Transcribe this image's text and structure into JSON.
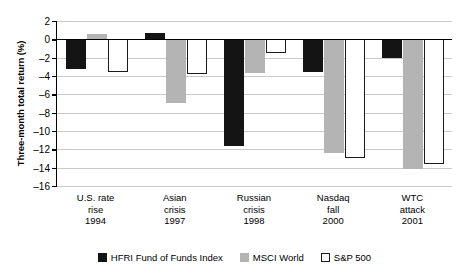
{
  "chart_data": {
    "type": "bar",
    "title": "",
    "xlabel": "",
    "ylabel": "Three-month total return (%)",
    "ylim": [
      -16,
      2
    ],
    "ytick_step": 2,
    "yticks": [
      2,
      0,
      -2,
      -4,
      -6,
      -8,
      -10,
      -12,
      -14,
      -16
    ],
    "ytick_labels": [
      "2",
      "0",
      "–2",
      "–4",
      "–6",
      "–8",
      "–10",
      "–12",
      "–14",
      "–16"
    ],
    "grid": true,
    "legend_position": "bottom",
    "categories": [
      "U.S. rate rise 1994",
      "Asian crisis 1997",
      "Russian crisis 1998",
      "Nasdaq fall 2000",
      "WTC attack 2001"
    ],
    "category_lines": [
      [
        "U.S. rate",
        "rise",
        "1994"
      ],
      [
        "Asian",
        "crisis",
        "1997"
      ],
      [
        "Russian",
        "crisis",
        "1998"
      ],
      [
        "Nasdaq",
        "fall",
        "2000"
      ],
      [
        "WTC",
        "attack",
        "2001"
      ]
    ],
    "series": [
      {
        "name": "HFRI Fund of Funds Index",
        "key": "hfri",
        "color": "#141414",
        "values": [
          -3.2,
          0.7,
          -11.6,
          -3.6,
          -2.0
        ]
      },
      {
        "name": "MSCI World",
        "key": "msci",
        "color": "#b4b4b4",
        "values": [
          0.6,
          -7.0,
          -3.7,
          -12.4,
          -14.1
        ]
      },
      {
        "name": "S&P 500",
        "key": "sp",
        "color": "#ffffff",
        "values": [
          -3.6,
          -3.8,
          -1.5,
          -13.0,
          -13.6
        ]
      }
    ]
  },
  "legend": {
    "items": [
      {
        "label": "HFRI Fund of Funds Index",
        "key": "hfri"
      },
      {
        "label": "MSCI World",
        "key": "msci"
      },
      {
        "label": "S&P 500",
        "key": "sp"
      }
    ]
  },
  "colors": {
    "hfri": "#141414",
    "msci": "#b4b4b4",
    "sp": "#ffffff",
    "axis": "#000000",
    "grid": "#c9c9c9",
    "background": "#ffffff"
  }
}
